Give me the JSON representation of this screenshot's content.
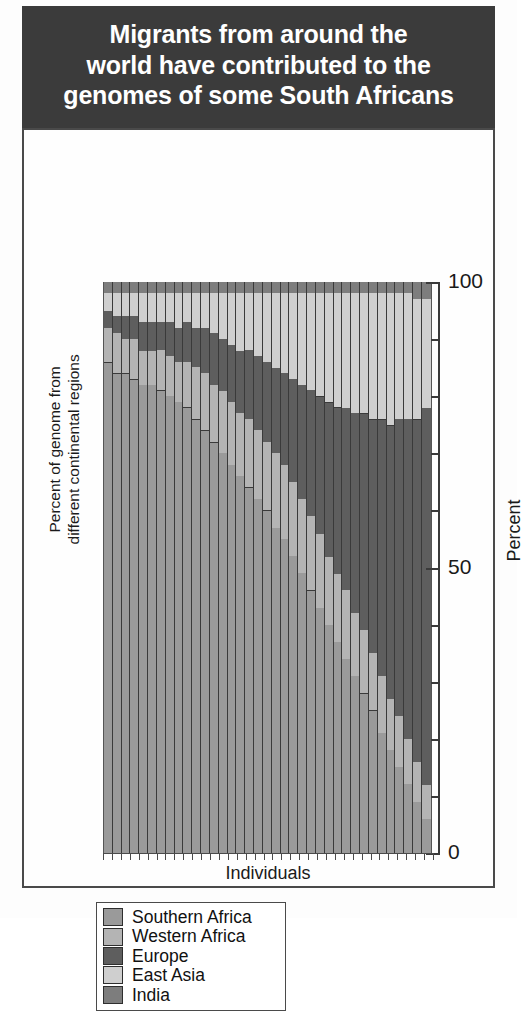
{
  "title": {
    "lines": [
      "Migrants from around the",
      "world have contributed to the",
      "genomes of some South Africans"
    ],
    "background": "#3b3b3b",
    "color": "#ffffff"
  },
  "legend": {
    "items": [
      {
        "label": "Southern Africa",
        "color": "#9a9a9a"
      },
      {
        "label": "Western Africa",
        "color": "#b4b4b4"
      },
      {
        "label": "Europe",
        "color": "#5e5e5e"
      },
      {
        "label": "East Asia",
        "color": "#cfcfcf"
      },
      {
        "label": "India",
        "color": "#7d7d7d"
      }
    ]
  },
  "axes": {
    "y_left_label_lines": [
      "Percent of genome from",
      "different continental regions"
    ],
    "y_right_label": "Percent",
    "x_label": "Individuals",
    "y_major_ticks": [
      0,
      50,
      100
    ],
    "y_minor_ticks": [
      10,
      20,
      30,
      40,
      60,
      70,
      80,
      90
    ]
  },
  "chart_data": {
    "type": "bar",
    "subtype": "stacked-bar-100-percent",
    "title": "Migrants from around the world have contributed to the genomes of some South Africans",
    "xlabel": "Individuals",
    "ylabel": "Percent of genome from different continental regions",
    "ylabel_right": "Percent",
    "ylim": [
      0,
      100
    ],
    "grid": false,
    "legend_position": "below-plot-left",
    "series": [
      {
        "name": "Southern Africa",
        "color": "#9a9a9a",
        "values": [
          86,
          84,
          84,
          83,
          82,
          82,
          81,
          80,
          79,
          78,
          76,
          74,
          72,
          70,
          68,
          66,
          64,
          62,
          60,
          57,
          55,
          52,
          49,
          46,
          43,
          40,
          37,
          34,
          31,
          28,
          25,
          21,
          18,
          15,
          12,
          9,
          6
        ]
      },
      {
        "name": "Western Africa",
        "color": "#b4b4b4",
        "values": [
          6,
          7,
          6,
          7,
          6,
          6,
          7,
          7,
          7,
          8,
          9,
          10,
          10,
          11,
          11,
          11,
          12,
          12,
          12,
          13,
          13,
          13,
          13,
          13,
          13,
          12,
          12,
          12,
          11,
          11,
          10,
          10,
          9,
          9,
          8,
          7,
          6
        ]
      },
      {
        "name": "Europe",
        "color": "#5e5e5e",
        "values": [
          3,
          3,
          4,
          4,
          5,
          5,
          5,
          6,
          6,
          7,
          7,
          8,
          9,
          9,
          10,
          11,
          12,
          13,
          14,
          15,
          16,
          18,
          20,
          22,
          24,
          27,
          29,
          32,
          35,
          38,
          41,
          45,
          48,
          52,
          56,
          60,
          66
        ]
      },
      {
        "name": "East Asia",
        "color": "#cfcfcf",
        "values": [
          3,
          4,
          4,
          4,
          5,
          5,
          5,
          5,
          6,
          5,
          6,
          6,
          7,
          8,
          9,
          10,
          10,
          11,
          12,
          13,
          14,
          15,
          16,
          17,
          18,
          19,
          20,
          20,
          21,
          21,
          22,
          22,
          23,
          22,
          22,
          21,
          19
        ]
      },
      {
        "name": "India",
        "color": "#7d7d7d",
        "values": [
          2,
          2,
          2,
          2,
          2,
          2,
          2,
          2,
          2,
          2,
          2,
          2,
          2,
          2,
          2,
          2,
          2,
          2,
          2,
          2,
          2,
          2,
          2,
          2,
          2,
          2,
          2,
          2,
          2,
          2,
          2,
          2,
          2,
          2,
          2,
          3,
          3
        ]
      }
    ],
    "n_individuals": 37,
    "note": "Each column is one individual; segments sum to 100 percent."
  }
}
